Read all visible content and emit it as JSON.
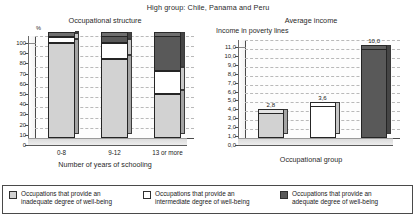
{
  "main_title": "High group: Chile, Panama and Peru",
  "colors": {
    "inadequate": "#d2d2d2",
    "intermediate": "#ffffff",
    "adequate": "#595959",
    "outline": "#252525",
    "grid": "#b9b9b9"
  },
  "legend": {
    "items": [
      {
        "swatch": "inadequate",
        "label": "Occupations that provide an\ninadequate degree of well-being"
      },
      {
        "swatch": "intermediate",
        "label": "Occupations that provide an\nintermediate degree of well-being"
      },
      {
        "swatch": "adequate",
        "label": "Occupations that provide an\nadequate degree of well-being"
      }
    ]
  },
  "chart_data": [
    {
      "type": "bar",
      "stacked": true,
      "title": "Occupational structure",
      "xlabel": "Number of years of schooling",
      "ylabel": "%",
      "ylim": [
        0,
        100
      ],
      "yticks": [
        "0",
        "10",
        "20",
        "30",
        "40",
        "50",
        "60",
        "70",
        "80",
        "90",
        "100"
      ],
      "grid": true,
      "categories": [
        "0-8",
        "9-12",
        "13 or more"
      ],
      "series": [
        {
          "name": "Occupations that provide an inadequate degree of well-being",
          "values": [
            93,
            77,
            43
          ]
        },
        {
          "name": "Occupations that provide an intermediate degree of well-being",
          "values": [
            6,
            16,
            23
          ]
        },
        {
          "name": "Occupations that provide an adequate degree of well-being",
          "values": [
            1,
            7,
            34
          ]
        }
      ]
    },
    {
      "type": "bar",
      "stacked": false,
      "title": "Average income",
      "xlabel": "Occupational group",
      "ylabel": "Income in poverty lines",
      "ylim": [
        0,
        11
      ],
      "yticks": [
        "0,0",
        "1,0",
        "2,0",
        "3,0",
        "4,0",
        "5,0",
        "6,0",
        "7,0",
        "8,0",
        "9,0",
        "10,0",
        "11,0"
      ],
      "grid": true,
      "categories": [
        "inadequate",
        "intermediate",
        "adequate"
      ],
      "values": [
        2.8,
        3.6,
        10.0
      ],
      "data_labels": [
        "2,8",
        "3,6",
        "10,0"
      ]
    }
  ]
}
